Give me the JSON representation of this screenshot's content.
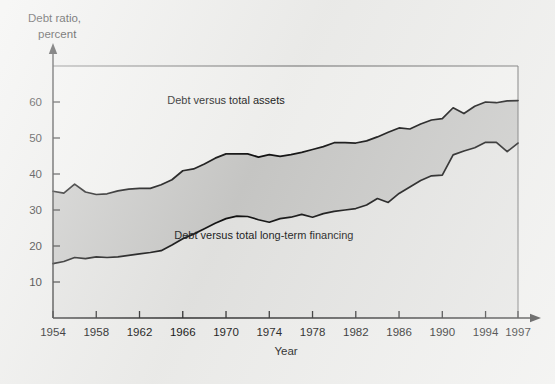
{
  "figure": {
    "background_color": "#eeeeec",
    "plot_background_color": "#f2f2f0",
    "band_fill_color": "#c9c9c7",
    "under_fill_color": "#e4e4e2",
    "line_color": "#111111"
  },
  "chart_data": {
    "type": "area",
    "title": "",
    "ylabel_line1": "Debt ratio,",
    "ylabel_line2": "percent",
    "xlabel": "Year",
    "grid": false,
    "legend_position": "inline-annotations",
    "xlim": [
      1954,
      1997
    ],
    "ylim": [
      0,
      70
    ],
    "y_ticks": [
      10,
      20,
      30,
      40,
      50,
      60
    ],
    "y_tick_labels": [
      "10",
      "20",
      "30",
      "40",
      "50",
      "60"
    ],
    "x_ticks": [
      1954,
      1958,
      1962,
      1966,
      1970,
      1974,
      1978,
      1982,
      1986,
      1990,
      1994,
      1997
    ],
    "x_tick_labels": [
      "1954",
      "1958",
      "1962",
      "1966",
      "1970",
      "1974",
      "1978",
      "1982",
      "1986",
      "1990",
      "1994",
      "1997"
    ],
    "annotations": [
      {
        "text": "Debt versus total assets",
        "x": 1970.0,
        "y": 59.5
      },
      {
        "text": "Debt versus total long-term financing",
        "x": 1973.5,
        "y": 22.0
      }
    ],
    "x": [
      1954,
      1955,
      1956,
      1957,
      1958,
      1959,
      1960,
      1961,
      1962,
      1963,
      1964,
      1965,
      1966,
      1967,
      1968,
      1969,
      1970,
      1971,
      1972,
      1973,
      1974,
      1975,
      1976,
      1977,
      1978,
      1979,
      1980,
      1981,
      1982,
      1983,
      1984,
      1985,
      1986,
      1987,
      1988,
      1989,
      1990,
      1991,
      1992,
      1993,
      1994,
      1995,
      1996,
      1997
    ],
    "series": [
      {
        "name": "Debt versus total assets",
        "values": [
          35.2,
          34.7,
          37.2,
          35.0,
          34.3,
          34.5,
          35.3,
          35.8,
          36.0,
          36.0,
          37.0,
          38.4,
          40.9,
          41.4,
          42.8,
          44.4,
          45.6,
          45.6,
          45.6,
          44.7,
          45.4,
          44.9,
          45.4,
          46.0,
          46.8,
          47.6,
          48.7,
          48.7,
          48.6,
          49.2,
          50.3,
          51.6,
          52.8,
          52.5,
          53.9,
          55.0,
          55.4,
          58.4,
          56.8,
          58.8,
          60.0,
          59.8,
          60.3,
          60.4
        ]
      },
      {
        "name": "Debt versus total long-term financing",
        "values": [
          15.1,
          15.7,
          16.8,
          16.5,
          17.0,
          16.8,
          17.0,
          17.4,
          17.8,
          18.2,
          18.7,
          20.3,
          22.0,
          23.3,
          24.8,
          26.3,
          27.6,
          28.3,
          28.2,
          27.3,
          26.6,
          27.6,
          28.0,
          28.8,
          28.0,
          29.0,
          29.6,
          30.0,
          30.4,
          31.4,
          33.2,
          32.1,
          34.6,
          36.4,
          38.2,
          39.5,
          39.7,
          45.3,
          46.4,
          47.3,
          48.8,
          48.8,
          46.2,
          48.6
        ]
      }
    ]
  }
}
